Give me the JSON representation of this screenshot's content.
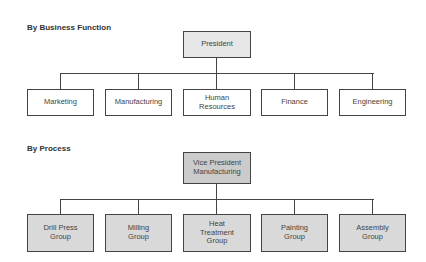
{
  "sections": [
    {
      "title": "By Business Function",
      "root": {
        "label": "President"
      },
      "children": [
        {
          "label": "Marketing"
        },
        {
          "label": "Manufacturing"
        },
        {
          "label": "Human\nResources"
        },
        {
          "label": "Finance"
        },
        {
          "label": "Engineering"
        }
      ]
    },
    {
      "title": "By Process",
      "root": {
        "label": "Vice President\nManufacturing"
      },
      "children": [
        {
          "label": "Drill Press\nGroup"
        },
        {
          "label": "Milling\nGroup"
        },
        {
          "label": "Heat\nTreatment\nGroup"
        },
        {
          "label": "Painting\nGroup"
        },
        {
          "label": "Assembly\nGroup"
        }
      ]
    }
  ],
  "colors": {
    "line": "#444444",
    "top_root_fill": "#e6e6e6",
    "top_child_fill": "#ffffff",
    "bottom_root_fill": "#cbcbcb",
    "bottom_child_fill": "#d9d9d9"
  }
}
